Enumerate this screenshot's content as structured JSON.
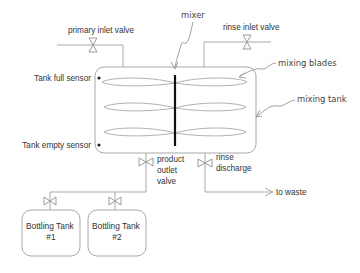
{
  "labels": {
    "mixer": "mixer",
    "primary_inlet_valve": "primary inlet valve",
    "rinse_inlet_valve": "rinse inlet valve",
    "mixing_blades": "mixing blades",
    "mixing_tank": "mixing tank",
    "tank_full_sensor": "Tank full sensor",
    "tank_empty_sensor": "Tank empty sensor",
    "product_outlet_valve": [
      "product",
      "outlet",
      "valve"
    ],
    "rinse_discharge": [
      "rinse",
      "discharge"
    ],
    "to_waste": "to waste",
    "bottling_tank_1": [
      "Bottling Tank",
      "#1"
    ],
    "bottling_tank_2": [
      "Bottling Tank",
      "#2"
    ]
  },
  "colors": {
    "background": "#ffffff",
    "lines": "#a0a0a0",
    "shaft": "#111111",
    "text": "#333333"
  },
  "components": [
    {
      "id": "mixing-tank",
      "type": "tank"
    },
    {
      "id": "mixer",
      "type": "agitator",
      "blades": 3
    },
    {
      "id": "primary-inlet-valve",
      "type": "valve"
    },
    {
      "id": "rinse-inlet-valve",
      "type": "valve"
    },
    {
      "id": "tank-full-sensor",
      "type": "sensor"
    },
    {
      "id": "tank-empty-sensor",
      "type": "sensor"
    },
    {
      "id": "product-outlet-valve",
      "type": "valve"
    },
    {
      "id": "rinse-discharge-valve",
      "type": "valve"
    },
    {
      "id": "bottling-tank-1-valve",
      "type": "valve"
    },
    {
      "id": "bottling-tank-2-valve",
      "type": "valve"
    },
    {
      "id": "bottling-tank-1",
      "type": "tank"
    },
    {
      "id": "bottling-tank-2",
      "type": "tank"
    }
  ]
}
